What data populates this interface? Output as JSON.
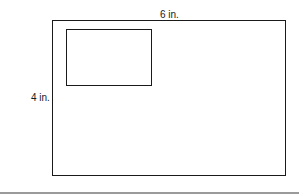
{
  "diagram": {
    "outer_rectangle": {
      "width_label": "6 in.",
      "height_label": "4 in."
    },
    "inner_rectangle": {
      "label": ""
    }
  },
  "colors": {
    "stroke": "#1a1a1a",
    "rule": "#9a9a9a",
    "background": "#ffffff"
  }
}
